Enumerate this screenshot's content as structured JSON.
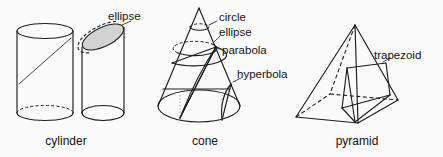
{
  "figure": {
    "background_color": "#fbfbfb",
    "line_color": "#1c1c1c",
    "shade_color": "#d2d2d2",
    "groups": [
      {
        "id": "cylinder",
        "name_label": "cylinder",
        "callouts": [
          "ellipse"
        ]
      },
      {
        "id": "cone",
        "name_label": "cone",
        "callouts": [
          "circle",
          "ellipse",
          "parabola",
          "hyperbola"
        ]
      },
      {
        "id": "pyramid",
        "name_label": "pyramid",
        "callouts": [
          "trapezoid"
        ]
      }
    ]
  },
  "labels": {
    "cylinder_ellipse": "ellipse",
    "cylinder_name": "cylinder",
    "cone_circle": "circle",
    "cone_ellipse": "ellipse",
    "cone_parabola": "parabola",
    "cone_hyperbola": "hyperbola",
    "cone_name": "cone",
    "pyramid_trapezoid": "trapezoid",
    "pyramid_name": "pyramid"
  }
}
